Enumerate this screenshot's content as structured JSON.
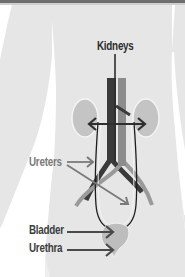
{
  "diagram": {
    "labels": {
      "kidneys": "Kidneys",
      "ureters": "Ureters",
      "bladder": "Bladder",
      "urethra": "Urethra"
    },
    "colors": {
      "background": "#ffffff",
      "body": "#e6e6e6",
      "kidney": "#c4c4c4",
      "bladder": "#bdbdbd",
      "aorta": "#3a3a3a",
      "vena_cava": "#8c8c8c",
      "ureter_outline": "#1e1e1e",
      "arrow_dark": "#333333",
      "arrow_gray": "#7a7a7a",
      "top_strip": "#6a6a6a"
    }
  }
}
